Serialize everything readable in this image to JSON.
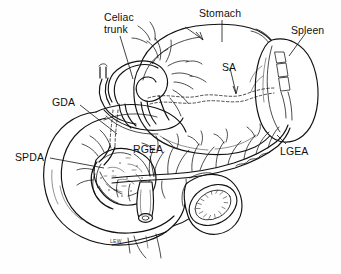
{
  "figure": {
    "type": "anatomical-line-drawing",
    "background_color": "#fefefe",
    "ink_color": "#101010",
    "signature": "LEW"
  },
  "labels": [
    {
      "id": "celiac-trunk",
      "text": "Celiac\ntrunk",
      "line1": "Celiac",
      "line2": "trunk",
      "x": 104,
      "y": 12,
      "full_name": "Celiac trunk"
    },
    {
      "id": "stomach",
      "text": "Stomach",
      "x": 199,
      "y": 8,
      "full_name": "Stomach"
    },
    {
      "id": "spleen",
      "text": "Spleen",
      "x": 291,
      "y": 25,
      "full_name": "Spleen"
    },
    {
      "id": "sa",
      "text": "SA",
      "x": 222,
      "y": 62,
      "full_name": "Splenic artery"
    },
    {
      "id": "gda",
      "text": "GDA",
      "x": 52,
      "y": 97,
      "full_name": "Gastroduodenal artery"
    },
    {
      "id": "spda",
      "text": "SPDA",
      "x": 15,
      "y": 152,
      "full_name": "Superior pancreaticoduodenal artery"
    },
    {
      "id": "rgea",
      "text": "RGEA",
      "x": 133,
      "y": 144,
      "full_name": "Right gastroepiploic artery"
    },
    {
      "id": "lgea",
      "text": "LGEA",
      "x": 280,
      "y": 146,
      "full_name": "Left gastroepiploic artery"
    }
  ],
  "structures": [
    {
      "id": "stomach-body",
      "name": "Stomach"
    },
    {
      "id": "spleen-body",
      "name": "Spleen"
    },
    {
      "id": "pancreas-head",
      "name": "Pancreatic head"
    },
    {
      "id": "duodenum-loop",
      "name": "Duodenal C-loop"
    },
    {
      "id": "bowel-cut-end",
      "name": "Cut bowel lumen"
    },
    {
      "id": "vessel-stump",
      "name": "Cut vessel stump"
    },
    {
      "id": "gastroepiploic-arcade",
      "name": "Gastroepiploic arterial arcade"
    },
    {
      "id": "splenic-artery-dashed",
      "name": "Splenic artery (hidden, dashed)"
    }
  ]
}
